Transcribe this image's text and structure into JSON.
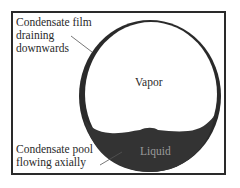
{
  "diagram": {
    "labels": {
      "film_line1": "Condensate film",
      "film_line2": "draining",
      "film_line3": "downwards",
      "pool_line1": "Condensate pool",
      "pool_line2": "flowing axially",
      "vapor": "Vapor",
      "liquid": "Liquid"
    },
    "colors": {
      "pipe_wall": "#2a2a2a",
      "liquid": "#333333",
      "background": "#ffffff",
      "liquid_text": "#9a9a9a"
    }
  }
}
